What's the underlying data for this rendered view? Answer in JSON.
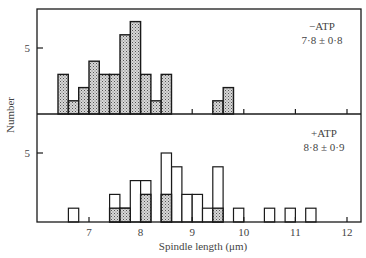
{
  "chart_data": {
    "type": "bar",
    "subtype": "histogram",
    "xlabel": "Spindle length (μm)",
    "ylabel": "Number",
    "x_ticks": [
      7,
      8,
      9,
      10,
      11,
      12
    ],
    "xlim": [
      6.0,
      12.25
    ],
    "bin_width": 0.2,
    "panels": [
      {
        "name": "minus-atp",
        "label": "−ATP",
        "stat": "7·8 ± 0·8",
        "y_ticks": [
          5
        ],
        "ylim": [
          0,
          8
        ],
        "series": [
          {
            "name": "stippled",
            "fill": "stipple",
            "bins": [
              {
                "x0": 6.4,
                "x1": 6.6,
                "count": 3
              },
              {
                "x0": 6.6,
                "x1": 6.8,
                "count": 1
              },
              {
                "x0": 6.8,
                "x1": 7.0,
                "count": 2
              },
              {
                "x0": 7.0,
                "x1": 7.2,
                "count": 4
              },
              {
                "x0": 7.2,
                "x1": 7.4,
                "count": 3
              },
              {
                "x0": 7.4,
                "x1": 7.6,
                "count": 3
              },
              {
                "x0": 7.6,
                "x1": 7.8,
                "count": 6
              },
              {
                "x0": 7.8,
                "x1": 8.0,
                "count": 7
              },
              {
                "x0": 8.0,
                "x1": 8.2,
                "count": 3
              },
              {
                "x0": 8.2,
                "x1": 8.4,
                "count": 1
              },
              {
                "x0": 8.4,
                "x1": 8.6,
                "count": 3
              },
              {
                "x0": 9.4,
                "x1": 9.6,
                "count": 1
              },
              {
                "x0": 9.6,
                "x1": 9.8,
                "count": 2
              }
            ]
          }
        ]
      },
      {
        "name": "plus-atp",
        "label": "+ATP",
        "stat": "8·8 ± 0·9",
        "y_ticks": [
          5
        ],
        "ylim": [
          0,
          8
        ],
        "series": [
          {
            "name": "total",
            "fill": "open",
            "bins": [
              {
                "x0": 6.6,
                "x1": 6.8,
                "count": 1
              },
              {
                "x0": 7.4,
                "x1": 7.6,
                "count": 2
              },
              {
                "x0": 7.6,
                "x1": 7.8,
                "count": 1
              },
              {
                "x0": 7.8,
                "x1": 8.0,
                "count": 3
              },
              {
                "x0": 8.0,
                "x1": 8.2,
                "count": 3
              },
              {
                "x0": 8.4,
                "x1": 8.6,
                "count": 5
              },
              {
                "x0": 8.6,
                "x1": 8.8,
                "count": 4
              },
              {
                "x0": 8.8,
                "x1": 9.0,
                "count": 2
              },
              {
                "x0": 9.0,
                "x1": 9.2,
                "count": 2
              },
              {
                "x0": 9.2,
                "x1": 9.4,
                "count": 1
              },
              {
                "x0": 9.4,
                "x1": 9.6,
                "count": 4
              },
              {
                "x0": 9.8,
                "x1": 10.0,
                "count": 1
              },
              {
                "x0": 10.4,
                "x1": 10.6,
                "count": 1
              },
              {
                "x0": 10.8,
                "x1": 11.0,
                "count": 1
              },
              {
                "x0": 11.2,
                "x1": 11.4,
                "count": 1
              }
            ]
          },
          {
            "name": "stippled",
            "fill": "stipple",
            "bins": [
              {
                "x0": 7.4,
                "x1": 7.6,
                "count": 1
              },
              {
                "x0": 7.6,
                "x1": 7.8,
                "count": 1
              },
              {
                "x0": 8.0,
                "x1": 8.2,
                "count": 2
              },
              {
                "x0": 8.4,
                "x1": 8.6,
                "count": 2
              },
              {
                "x0": 9.4,
                "x1": 9.6,
                "count": 1
              }
            ]
          }
        ]
      }
    ],
    "grid": false,
    "legend": "text annotations in upper right of each panel"
  },
  "axes": {
    "y_tick_label": "5",
    "x_tick_labels": [
      "7",
      "8",
      "9",
      "10",
      "11",
      "12"
    ]
  },
  "colors": {
    "line": "#1a1a1a",
    "stipple_bg": "#d8d8d8",
    "stipple_dot": "#555555",
    "text": "#444444"
  }
}
